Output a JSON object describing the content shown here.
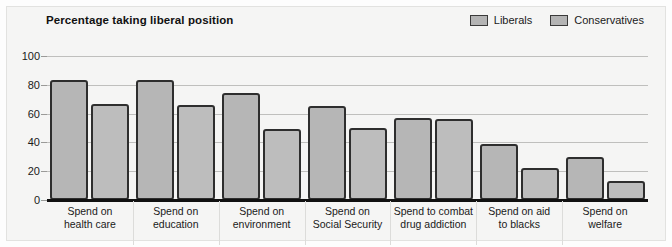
{
  "chart_data": {
    "type": "bar",
    "title": "Percentage taking liberal position",
    "xlabel": "",
    "ylabel": "",
    "ylim": [
      0,
      100
    ],
    "yticks": [
      "0",
      "20",
      "40",
      "60",
      "80",
      "100"
    ],
    "grid": true,
    "legend_position": "top-right",
    "categories": [
      "Spend on health care",
      "Spend on education",
      "Spend on environment",
      "Spend on Social Security",
      "Spend to combat drug addiction",
      "Spend on aid to blacks",
      "Spend on welfare"
    ],
    "category_lines": [
      [
        "Spend on",
        "health care"
      ],
      [
        "Spend on",
        "education"
      ],
      [
        "Spend on",
        "environment"
      ],
      [
        "Spend on",
        "Social Security"
      ],
      [
        "Spend to combat",
        "drug addiction"
      ],
      [
        "Spend on aid",
        "to blacks"
      ],
      [
        "Spend on",
        "welfare"
      ]
    ],
    "series": [
      {
        "name": "Liberals",
        "values": [
          83,
          83,
          74,
          65,
          57,
          39,
          30
        ]
      },
      {
        "name": "Conservatives",
        "values": [
          67,
          66,
          49,
          50,
          56,
          22,
          13
        ]
      }
    ],
    "colors": {
      "bar_fill": "#b6b6b6",
      "bar_outline": "#2e2e2e",
      "background": "#f5f5f4",
      "gridline": "#bfbfbd",
      "axis": "#111111",
      "text": "#1a1a1a"
    }
  }
}
